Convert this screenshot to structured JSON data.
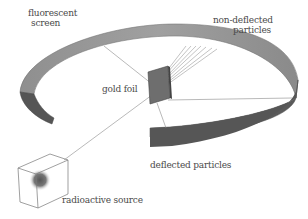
{
  "diagram": {
    "labels": {
      "screen": [
        "fluorescent",
        "screen"
      ],
      "gold_foil": "gold foil",
      "non_deflected": [
        "non-deflected",
        "particles"
      ],
      "deflected": "deflected particles",
      "source": "radioactive source"
    },
    "components": [
      {
        "id": "fluorescent-screen",
        "shape": "circular band"
      },
      {
        "id": "gold-foil",
        "shape": "thin sheet"
      },
      {
        "id": "radioactive-source",
        "shape": "cube with glowing core"
      }
    ],
    "colors": {
      "screen_outer": "#9a9a9a",
      "screen_inner": "#5a5a5a",
      "foil": "#6e6e6e",
      "lines": "#8a8a8a",
      "text": "#4a4a4a"
    }
  }
}
